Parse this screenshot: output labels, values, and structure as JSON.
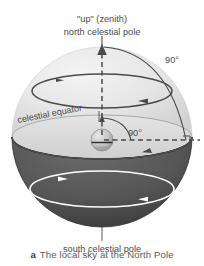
{
  "figure": {
    "labels": {
      "zenith": "\"up\" (zenith)",
      "north_pole": "north celestial pole",
      "angle_outer": "90°",
      "angle_inner": "90°",
      "celestial_equator": "celestial equator",
      "south_pole": "south celestial pole"
    },
    "caption": {
      "letter": "a",
      "text": "The local sky at the North Pole"
    },
    "colors": {
      "upper_hemisphere": "#e2e2e2",
      "upper_hemisphere_edge": "#f2f2f2",
      "lower_hemisphere": "#565656",
      "lower_hemisphere_shade": "#414141",
      "horizon_plane": "#dcdcdc",
      "line_dark": "#4a4a4a",
      "line_white": "#ffffff",
      "text": "#4a4a4a",
      "background": "#ffffff",
      "earth": "#c9c9c9"
    }
  }
}
